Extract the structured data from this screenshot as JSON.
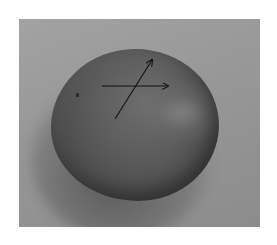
{
  "image": {
    "description": "Grayscale photograph of a round citrus fruit (orange) on a gray background with two hand-drawn arrows",
    "subject": "orange fruit",
    "colors": {
      "background_page": "#ffffff",
      "photo_background": "#989898",
      "fruit": "#5a5a5a",
      "arrow": "#111111"
    },
    "arrows": [
      {
        "name": "horizontal-arrow",
        "from": [
          83,
          67
        ],
        "to": [
          149,
          67
        ]
      },
      {
        "name": "diagonal-arrow",
        "from": [
          96,
          100
        ],
        "to": [
          133,
          41
        ]
      }
    ]
  }
}
